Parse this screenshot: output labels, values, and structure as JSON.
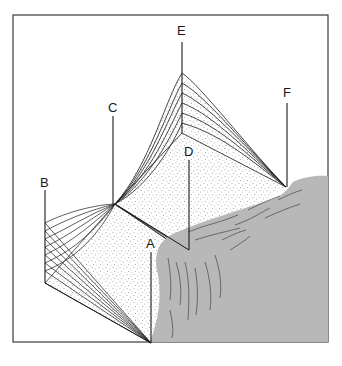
{
  "diagram": {
    "type": "geometric-surface-diagram",
    "labels": [
      {
        "id": "A",
        "text": "A"
      },
      {
        "id": "B",
        "text": "B"
      },
      {
        "id": "C",
        "text": "C"
      },
      {
        "id": "D",
        "text": "D"
      },
      {
        "id": "E",
        "text": "E"
      },
      {
        "id": "F",
        "text": "F"
      }
    ],
    "colors": {
      "frame": "#3a3a3a",
      "line": "#1a1a1a",
      "stipple": "#555555",
      "water": "#b8b8b8",
      "background": "#ffffff"
    }
  }
}
